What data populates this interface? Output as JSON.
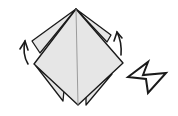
{
  "diagram": {
    "type": "origami-fold-step",
    "colors": {
      "paper": "#e6e6e6",
      "stroke": "#1a1a1a",
      "background": "#ffffff"
    },
    "elements": [
      "paper-model",
      "left-fold-arrow",
      "right-fold-arrow",
      "push-arrow"
    ]
  }
}
